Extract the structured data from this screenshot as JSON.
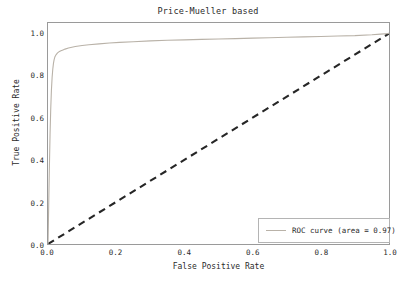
{
  "chart_data": {
    "type": "line",
    "title": "Price-Mueller based",
    "xlabel": "False Positive Rate",
    "ylabel": "True Positive Rate",
    "xlim": [
      0.0,
      1.0
    ],
    "ylim": [
      0.0,
      1.05
    ],
    "grid": false,
    "legend_position": "lower right",
    "xticks": [
      "0.0",
      "0.2",
      "0.4",
      "0.6",
      "0.8",
      "1.0"
    ],
    "xtick_values": [
      0.0,
      0.2,
      0.4,
      0.6,
      0.8,
      1.0
    ],
    "yticks": [
      "0.0",
      "0.2",
      "0.4",
      "0.6",
      "0.8",
      "1.0"
    ],
    "ytick_values": [
      0.0,
      0.2,
      0.4,
      0.6,
      0.8,
      1.0
    ],
    "series": [
      {
        "name": "ROC curve (area = 0.97)",
        "style": "solid",
        "color": "#b9b2a8",
        "area": 0.97,
        "x": [
          0.0,
          0.002,
          0.004,
          0.006,
          0.008,
          0.01,
          0.012,
          0.014,
          0.016,
          0.018,
          0.02,
          0.024,
          0.028,
          0.032,
          0.038,
          0.044,
          0.05,
          0.06,
          0.07,
          0.08,
          0.1,
          0.12,
          0.15,
          0.18,
          0.21,
          0.25,
          0.3,
          0.35,
          0.4,
          0.45,
          0.5,
          0.55,
          0.6,
          0.65,
          0.7,
          0.75,
          0.8,
          0.85,
          0.9,
          0.95,
          0.975,
          1.0
        ],
        "y": [
          0.0,
          0.18,
          0.36,
          0.52,
          0.64,
          0.73,
          0.79,
          0.83,
          0.858,
          0.876,
          0.888,
          0.9,
          0.908,
          0.913,
          0.918,
          0.922,
          0.926,
          0.931,
          0.935,
          0.938,
          0.943,
          0.947,
          0.951,
          0.955,
          0.958,
          0.961,
          0.965,
          0.968,
          0.97,
          0.972,
          0.974,
          0.976,
          0.978,
          0.98,
          0.982,
          0.984,
          0.986,
          0.988,
          0.99,
          0.994,
          0.997,
          1.0
        ]
      },
      {
        "name": "chance-diagonal",
        "style": "dashed",
        "color": "#262626",
        "x": [
          0.0,
          1.0
        ],
        "y": [
          0.0,
          1.0
        ]
      }
    ]
  },
  "legend": {
    "roc_label": "ROC curve (area = 0.97)"
  }
}
